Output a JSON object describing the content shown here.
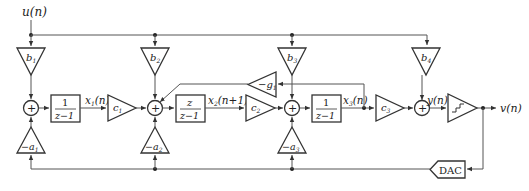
{
  "diagram": {
    "type": "delta-sigma-modulator-block-diagram",
    "input_label": "u(n)",
    "output_label": "v(n)",
    "quantizer_input_label": "y(n)",
    "feedforward_gains": [
      {
        "id": "b1",
        "base": "b",
        "sub": "1"
      },
      {
        "id": "b2",
        "base": "b",
        "sub": "2"
      },
      {
        "id": "b3",
        "base": "b",
        "sub": "3"
      },
      {
        "id": "b4",
        "base": "b",
        "sub": "4"
      }
    ],
    "feedback_gains": [
      {
        "id": "a1",
        "prefix": "−",
        "base": "a",
        "sub": "1"
      },
      {
        "id": "a2",
        "prefix": "−",
        "base": "a",
        "sub": "2"
      },
      {
        "id": "a3",
        "prefix": "−",
        "base": "a",
        "sub": "3"
      }
    ],
    "interstage_gains": [
      {
        "id": "c1",
        "base": "c",
        "sub": "1"
      },
      {
        "id": "c2",
        "base": "c",
        "sub": "2"
      },
      {
        "id": "c3",
        "base": "c",
        "sub": "3"
      }
    ],
    "resonator_gain": {
      "prefix": "−",
      "base": "g",
      "sub": "1"
    },
    "integrators": [
      {
        "numerator": "1",
        "denominator": "z−1"
      },
      {
        "numerator": "z",
        "denominator": "z−1"
      },
      {
        "numerator": "1",
        "denominator": "z−1"
      }
    ],
    "state_labels": [
      {
        "base": "x",
        "sub": "1",
        "arg": "(n)"
      },
      {
        "base": "x",
        "sub": "2",
        "arg": "(n+1)"
      },
      {
        "base": "x",
        "sub": "3",
        "arg": "(n)"
      }
    ],
    "sum_symbol": "+",
    "dac_label": "DAC"
  }
}
